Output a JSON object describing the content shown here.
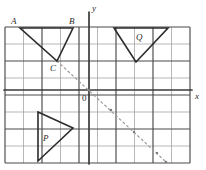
{
  "figure": {
    "background_color": "#ffffff",
    "grid": {
      "minor_line_color": "#9a9a9a",
      "major_line_color": "#4a4a4a",
      "axis_color": "#3a3a3a",
      "left": 5,
      "top": 27,
      "right": 190,
      "bottom": 163,
      "cell_width": 18.5,
      "cell_height": 17,
      "columns": 10,
      "rows": 8
    },
    "axes": {
      "x_axis_label": "x",
      "y_axis_label": "y",
      "origin_label": "0",
      "origin_x": 89,
      "origin_y": 90,
      "x_label_pos": {
        "x": 195,
        "y": 92
      },
      "y_label_pos": {
        "x": 92,
        "y": 4
      },
      "origin_label_pos": {
        "x": 82,
        "y": 94
      }
    },
    "shapes": [
      {
        "name": "triangle-abc",
        "stroke_color": "#2b2b2b",
        "stroke_width": 1.6,
        "points": "20,28 73,28 57,61",
        "vertices": [
          {
            "label": "A",
            "x": 20,
            "y": 28,
            "label_x": 11,
            "label_y": 17
          },
          {
            "label": "B",
            "x": 73,
            "y": 28,
            "label_x": 69,
            "label_y": 17
          },
          {
            "label": "C",
            "x": 57,
            "y": 61,
            "label_x": 50,
            "label_y": 64
          }
        ]
      },
      {
        "name": "triangle-q",
        "stroke_color": "#2b2b2b",
        "stroke_width": 1.6,
        "points": "114,28 168,28 136,62",
        "vertices": [
          {
            "label": "Q",
            "x": 140,
            "y": 38,
            "label_x": 136,
            "label_y": 33
          }
        ]
      },
      {
        "name": "triangle-p",
        "stroke_color": "#2b2b2b",
        "stroke_width": 1.6,
        "points": "38,112 73,128 38,161",
        "vertices": [
          {
            "label": "P",
            "x": 47,
            "y": 139,
            "label_x": 43,
            "label_y": 134
          }
        ]
      }
    ],
    "dashed_line": {
      "name": "construction-line",
      "color": "#9b9b9b",
      "stroke_width": 1.2,
      "dash_pattern": "2,3",
      "from": {
        "x": 57,
        "y": 61
      },
      "to": {
        "x": 166,
        "y": 162
      },
      "marker_points": [
        {
          "x": 57,
          "y": 61
        },
        {
          "x": 89,
          "y": 90
        },
        {
          "x": 111,
          "y": 110
        },
        {
          "x": 134,
          "y": 132
        },
        {
          "x": 157,
          "y": 153
        },
        {
          "x": 166,
          "y": 162
        }
      ]
    }
  },
  "chart_data": {
    "type": "scatter",
    "xlabel": "x",
    "ylabel": "y",
    "grid": true,
    "legend": "none",
    "xlim": [
      -5,
      6
    ],
    "ylim": [
      -5,
      4
    ],
    "annotations": [
      "A",
      "B",
      "C",
      "P",
      "Q",
      "0",
      "x",
      "y"
    ],
    "series": [
      {
        "name": "triangle ABC",
        "kind": "polygon",
        "x": [
          -4,
          -1,
          -2
        ],
        "y": [
          3,
          3,
          1
        ],
        "labels": [
          "A",
          "B",
          "C"
        ]
      },
      {
        "name": "triangle Q",
        "kind": "polygon",
        "x": [
          1,
          4,
          2
        ],
        "y": [
          3,
          3,
          1
        ],
        "labels": [
          "",
          "",
          ""
        ]
      },
      {
        "name": "triangle P",
        "kind": "polygon",
        "x": [
          -3,
          -1,
          -3
        ],
        "y": [
          -1,
          -2,
          -4
        ],
        "labels": [
          "",
          "",
          ""
        ]
      },
      {
        "name": "dashed construction line",
        "kind": "line",
        "style": "dashed",
        "x": [
          -2,
          4
        ],
        "y": [
          1,
          -4
        ]
      }
    ]
  }
}
